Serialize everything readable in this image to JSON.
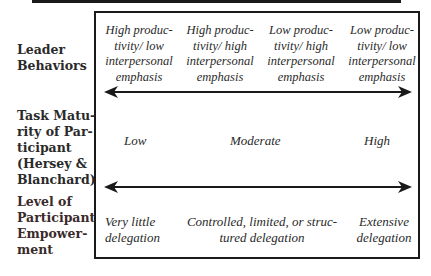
{
  "row_labels": {
    "leader_behaviors": [
      "Leader",
      "Behaviors"
    ],
    "task_maturity": [
      "Task Matu-",
      "rity of Par-",
      "ticipant",
      "(Hersey &",
      "Blanchard)"
    ],
    "participant_empowerment": [
      "Level of",
      "Participant",
      "Empower-",
      "ment"
    ]
  },
  "leader_behaviors": [
    [
      "High produc-",
      "tivity/ low",
      "interpersonal",
      "emphasis"
    ],
    [
      "High produc-",
      "tivity/ high",
      "interpersonal",
      "emphasis"
    ],
    [
      "Low produc-",
      "tivity/ high",
      "interpersonal",
      "emphasis"
    ],
    [
      "Low produc-",
      "tivity/ low",
      "interpersonal",
      "emphasis"
    ]
  ],
  "task_maturity": [
    "Low",
    "Moderate",
    "High"
  ],
  "participant_empowerment": [
    [
      "Very little",
      "delegation"
    ],
    [
      "Controlled, limited, or struc-",
      "tured delegation"
    ],
    [
      "Extensive",
      "delegation"
    ]
  ],
  "colors": {
    "line": "#1a1a1a",
    "text": "#2a2a2a"
  }
}
